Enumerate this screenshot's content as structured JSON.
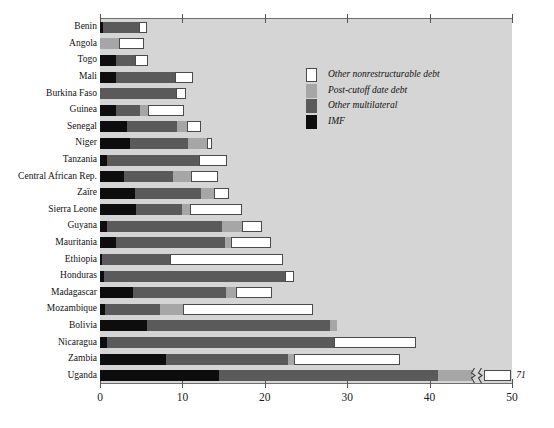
{
  "chart_data": {
    "type": "bar",
    "orientation": "horizontal",
    "stacked": true,
    "title": "",
    "subtitle": "",
    "xlabel": "",
    "ylabel": "",
    "xlim": [
      0,
      50
    ],
    "xticks": [
      0,
      10,
      20,
      30,
      40,
      50
    ],
    "xtick_labels": [
      "0",
      "10",
      "20",
      "30",
      "40",
      "50"
    ],
    "grid": false,
    "legend_position": "inside-top-right",
    "categories": [
      "Benin",
      "Angola",
      "Togo",
      "Mali",
      "Burkina Faso",
      "Guinea",
      "Senegal",
      "Niger",
      "Tanzania",
      "Central African Rep.",
      "Zaïre",
      "Sierra Leone",
      "Guyana",
      "Mauritania",
      "Ethiopia",
      "Honduras",
      "Madagascar",
      "Mozambique",
      "Bolivia",
      "Nicaragua",
      "Zambia",
      "Uganda"
    ],
    "series": [
      {
        "name": "IMF",
        "color": "#0d0d0d",
        "values": [
          0.4,
          0.0,
          2.0,
          1.9,
          0.0,
          1.9,
          3.3,
          3.6,
          0.8,
          2.9,
          4.2,
          4.4,
          0.8,
          1.9,
          0.3,
          0.5,
          4.0,
          0.6,
          5.7,
          0.9,
          8.0,
          14.4
        ]
      },
      {
        "name": "Other multilateral",
        "color": "#5a5a5a",
        "values": [
          4.3,
          0.0,
          2.3,
          7.2,
          9.2,
          2.9,
          6.0,
          7.1,
          11.2,
          5.9,
          8.0,
          5.6,
          14.0,
          13.3,
          8.2,
          22.0,
          11.3,
          6.7,
          22.2,
          27.5,
          14.8,
          26.6
        ]
      },
      {
        "name": "Post-cutoff date debt",
        "color": "#a6a6a6",
        "values": [
          0.0,
          2.3,
          0.0,
          0.0,
          0.0,
          1.0,
          1.2,
          2.3,
          0.0,
          2.2,
          1.6,
          0.9,
          2.4,
          0.7,
          0.0,
          0.0,
          1.2,
          2.8,
          0.9,
          0.0,
          0.8,
          5.0
        ]
      },
      {
        "name": "Other nonrestructurable debt",
        "color": "#ffffff",
        "values": [
          1.0,
          3.0,
          1.5,
          2.2,
          1.2,
          4.4,
          1.8,
          0.6,
          3.4,
          3.3,
          1.8,
          6.3,
          2.5,
          4.8,
          13.7,
          1.0,
          4.4,
          15.7,
          0.0,
          9.9,
          12.8,
          25.0
        ]
      }
    ],
    "totals": [
      5.7,
      5.3,
      5.8,
      11.3,
      10.4,
      10.2,
      12.3,
      13.6,
      15.4,
      14.3,
      15.6,
      17.2,
      19.7,
      20.7,
      22.2,
      23.5,
      20.9,
      25.8,
      28.8,
      38.3,
      36.4,
      71.0
    ],
    "annotations": [
      {
        "category": "Uganda",
        "label": "71",
        "note": "bar is truncated with an axis-break marker; true total is 71"
      }
    ],
    "legend": [
      {
        "label": "Other nonrestructurable debt",
        "color": "#ffffff",
        "swatch": "white-swatch"
      },
      {
        "label": "Post-cutoff date debt",
        "color": "#a6a6a6",
        "swatch": "light-gray-swatch"
      },
      {
        "label": "Other multilateral",
        "color": "#5a5a5a",
        "swatch": "dark-gray-swatch"
      },
      {
        "label": "IMF",
        "color": "#0d0d0d",
        "swatch": "black-swatch"
      }
    ],
    "colors": {
      "plot_background": "#d5d5d5",
      "page_background": "#ffffff",
      "axis": "#6e6e6e",
      "text": "#111111"
    }
  }
}
